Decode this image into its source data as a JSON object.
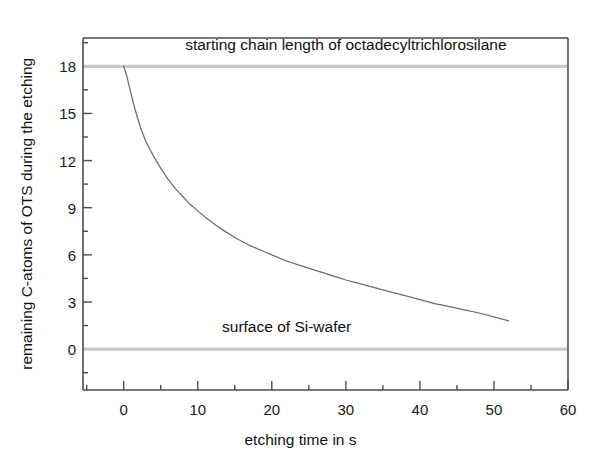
{
  "chart_data": {
    "type": "line",
    "title": "",
    "xlabel": "etching time in s",
    "ylabel": "remaining C-atoms of OTS during the etching",
    "xlim": [
      -5.5,
      60
    ],
    "ylim": [
      -2.6,
      19.8
    ],
    "grid": false,
    "legend": null,
    "xticks": [
      0,
      10,
      20,
      30,
      40,
      50,
      60
    ],
    "xticklabels": [
      "0",
      "10",
      "20",
      "30",
      "40",
      "50",
      "60"
    ],
    "xminor_step": 5,
    "yticks": [
      0,
      3,
      6,
      9,
      12,
      15,
      18
    ],
    "yticklabels": [
      "0",
      "3",
      "6",
      "9",
      "12",
      "15",
      "18"
    ],
    "yminor_step": 1.5,
    "series": [
      {
        "name": "remaining C-atoms",
        "color": "#6b6b6b",
        "x": [
          0.0,
          0.4,
          0.9,
          1.5,
          2.2,
          3.0,
          4.0,
          5.0,
          6.0,
          7.0,
          8.0,
          9.0,
          10.0,
          11.0,
          12.0,
          13.0,
          14.0,
          15.0,
          16.0,
          17.0,
          18.0,
          19.0,
          20.0,
          21.0,
          22.0,
          23.0,
          24.0,
          25.0,
          26.0,
          27.0,
          28.0,
          29.0,
          30.0,
          32.0,
          34.0,
          36.0,
          38.0,
          40.0,
          42.0,
          44.0,
          46.0,
          48.0,
          50.0,
          52.0
        ],
        "y": [
          18.0,
          17.4,
          16.4,
          15.3,
          14.2,
          13.2,
          12.3,
          11.5,
          10.8,
          10.2,
          9.7,
          9.2,
          8.8,
          8.4,
          8.05,
          7.7,
          7.4,
          7.1,
          6.85,
          6.6,
          6.4,
          6.2,
          6.0,
          5.8,
          5.6,
          5.45,
          5.3,
          5.15,
          5.0,
          4.85,
          4.7,
          4.55,
          4.4,
          4.15,
          3.9,
          3.65,
          3.4,
          3.15,
          2.9,
          2.7,
          2.5,
          2.3,
          2.05,
          1.8
        ]
      }
    ],
    "reference_lines": [
      {
        "name": "starting-chain-length-line",
        "y": 18,
        "color": "#c9c9c9",
        "label": "starting chain length of octadecyltrichlorosilane",
        "label_x": 30,
        "label_y": 19.0
      },
      {
        "name": "si-wafer-surface-line",
        "y": 0,
        "color": "#c9c9c9",
        "label": "surface of Si-wafer",
        "label_x": 22,
        "label_y": 1.05
      }
    ],
    "axis_color": "#4d4d4d",
    "curve_color": "#6b6b6b"
  }
}
